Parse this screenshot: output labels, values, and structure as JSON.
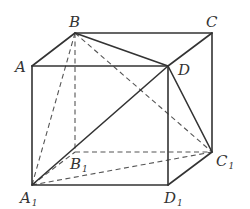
{
  "diagram": {
    "vertices": {
      "A": {
        "label": "A",
        "sub": "",
        "x": 32,
        "y": 66,
        "lx": 15,
        "ly": 72
      },
      "B": {
        "label": "B",
        "sub": "",
        "x": 75,
        "y": 33,
        "lx": 69,
        "ly": 27
      },
      "C": {
        "label": "C",
        "sub": "",
        "x": 212,
        "y": 33,
        "lx": 206,
        "ly": 27
      },
      "D": {
        "label": "D",
        "sub": "",
        "x": 168,
        "y": 66,
        "lx": 178,
        "ly": 75
      },
      "A1": {
        "label": "A",
        "sub": "1",
        "x": 32,
        "y": 185,
        "lx": 20,
        "ly": 203
      },
      "B1": {
        "label": "B",
        "sub": "1",
        "x": 75,
        "y": 152,
        "lx": 70,
        "ly": 169
      },
      "C1": {
        "label": "C",
        "sub": "1",
        "x": 212,
        "y": 152,
        "lx": 216,
        "ly": 166
      },
      "D1": {
        "label": "D",
        "sub": "1",
        "x": 168,
        "y": 185,
        "lx": 164,
        "ly": 203
      }
    },
    "solid_edges": [
      [
        "A",
        "B"
      ],
      [
        "B",
        "C"
      ],
      [
        "A",
        "D"
      ],
      [
        "C",
        "D"
      ],
      [
        "B",
        "D"
      ],
      [
        "A",
        "A1"
      ],
      [
        "C",
        "C1"
      ],
      [
        "D",
        "D1"
      ],
      [
        "A1",
        "D1"
      ],
      [
        "D1",
        "C1"
      ],
      [
        "A1",
        "D"
      ],
      [
        "D",
        "C1"
      ]
    ],
    "dashed_edges": [
      [
        "B",
        "B1"
      ],
      [
        "A1",
        "B1"
      ],
      [
        "B1",
        "C1"
      ],
      [
        "B",
        "A1"
      ],
      [
        "B",
        "C1"
      ],
      [
        "A1",
        "C1"
      ]
    ],
    "colors": {
      "line": "#333333",
      "dashed": "#555555",
      "background": "#ffffff"
    }
  }
}
